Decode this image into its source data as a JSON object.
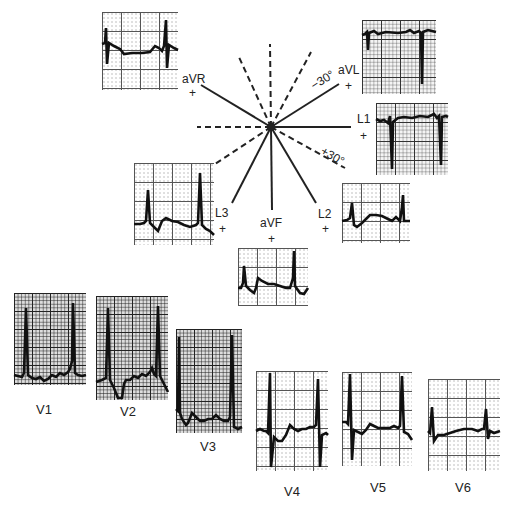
{
  "diagram": {
    "title": "",
    "type": "hexaxial reference system with 12-lead ECG",
    "center": {
      "x": 271,
      "y": 127
    },
    "angles": {
      "minus30": "−30°",
      "plus30": "+30°"
    },
    "limb_leads": [
      {
        "id": "aVR",
        "label": "aVR",
        "sign": "+"
      },
      {
        "id": "aVL",
        "label": "aVL",
        "sign": "+"
      },
      {
        "id": "L1",
        "label": "L1",
        "sign": "+"
      },
      {
        "id": "L2",
        "label": "L2",
        "sign": "+"
      },
      {
        "id": "aVF",
        "label": "aVF",
        "sign": "+"
      },
      {
        "id": "L3",
        "label": "L3",
        "sign": "+"
      }
    ],
    "precordial_leads": [
      {
        "id": "V1",
        "label": "V1"
      },
      {
        "id": "V2",
        "label": "V2"
      },
      {
        "id": "V3",
        "label": "V3"
      },
      {
        "id": "V4",
        "label": "V4"
      },
      {
        "id": "V5",
        "label": "V5"
      },
      {
        "id": "V6",
        "label": "V6"
      }
    ]
  },
  "colors": {
    "ink": "#222222",
    "grid": "#333333",
    "paper": "#f4f4f4"
  }
}
